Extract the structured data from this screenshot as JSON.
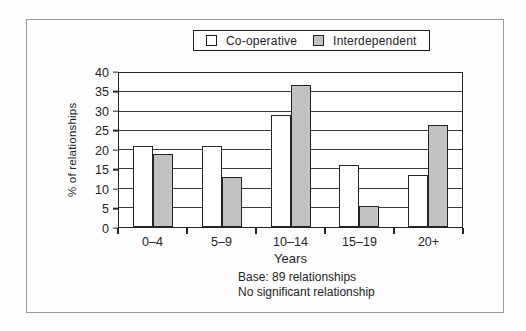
{
  "chart_data": {
    "type": "bar",
    "categories": [
      "0–4",
      "5–9",
      "10–14",
      "15–19",
      "20+"
    ],
    "series": [
      {
        "name": "Co-operative",
        "fill": "#ffffff",
        "values": [
          21,
          21,
          29,
          16,
          13.5
        ]
      },
      {
        "name": "Interdependent",
        "fill": "#c2c2c0",
        "values": [
          19,
          13,
          37,
          5.5,
          26.5
        ]
      }
    ],
    "xlabel": "Years",
    "ylabel": "% of relationships",
    "ylim": [
      0,
      40
    ],
    "ytick_step": 5,
    "grid": true,
    "legend_position": "top-center",
    "footnotes": [
      "Base: 89 relationships",
      "No significant relationship"
    ]
  }
}
